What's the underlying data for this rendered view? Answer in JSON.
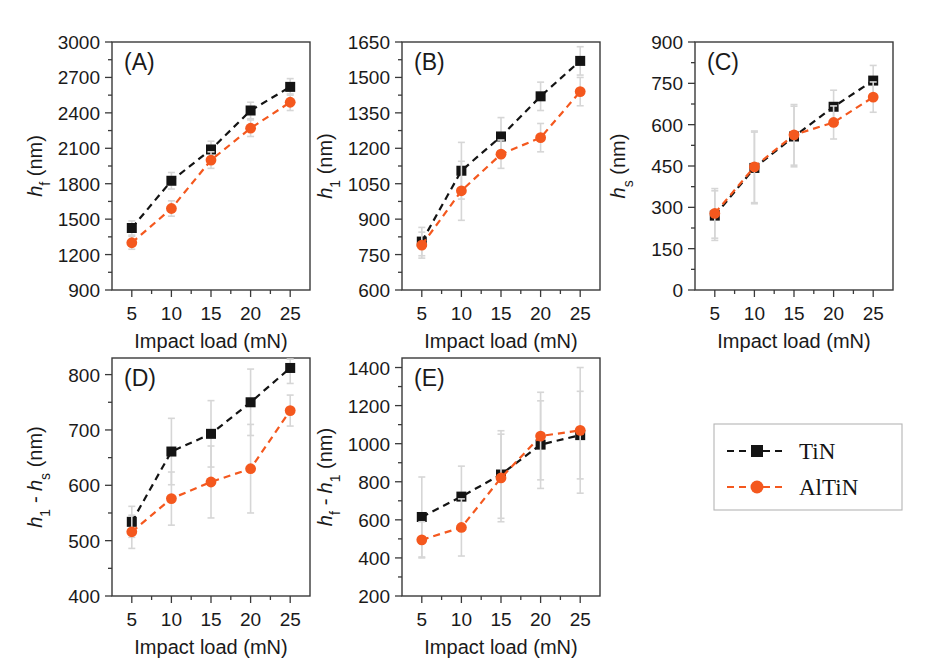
{
  "figure": {
    "background": "#ffffff",
    "series_colors": {
      "TiN": "#141414",
      "AlTiN": "#f4581e",
      "error_bar": "#d6d6d6"
    },
    "xlabel": "Impact load (mN)",
    "xticks": [
      "5",
      "10",
      "15",
      "20",
      "25"
    ],
    "units": "nm"
  },
  "legend": {
    "position": "bottom-right",
    "entries": [
      {
        "label": "TiN",
        "marker": "square",
        "color": "#141414",
        "line": "dashed"
      },
      {
        "label": "AlTiN",
        "marker": "circle",
        "color": "#f4581e",
        "line": "dashed"
      }
    ]
  },
  "panels": {
    "A": {
      "label": "(A)",
      "ylabel_html": "h_f (nm)",
      "ylabel_main": "h",
      "ylabel_sub": "f",
      "ylabel_unit": " (nm)",
      "yticks": [
        "900",
        "1200",
        "1500",
        "1800",
        "2100",
        "2400",
        "2700",
        "3000"
      ]
    },
    "B": {
      "label": "(B)",
      "ylabel_main": "h",
      "ylabel_sub": "1",
      "ylabel_unit": " (nm)",
      "yticks": [
        "600",
        "750",
        "900",
        "1050",
        "1200",
        "1350",
        "1500",
        "1650"
      ]
    },
    "C": {
      "label": "(C)",
      "ylabel_main": "h",
      "ylabel_sub": "s",
      "ylabel_unit": " (nm)",
      "yticks": [
        "0",
        "150",
        "300",
        "450",
        "600",
        "750",
        "900"
      ]
    },
    "D": {
      "label": "(D)",
      "ylabel_main": "h",
      "ylabel_sub": "1",
      "ylabel_mid": " - h",
      "ylabel_sub2": "s",
      "ylabel_unit": " (nm)",
      "yticks": [
        "400",
        "500",
        "600",
        "700",
        "800"
      ]
    },
    "E": {
      "label": "(E)",
      "ylabel_main": "h",
      "ylabel_sub": "f",
      "ylabel_mid": " - h",
      "ylabel_sub2": "1",
      "ylabel_unit": " (nm)",
      "yticks": [
        "200",
        "400",
        "600",
        "800",
        "1000",
        "1200",
        "1400"
      ]
    }
  },
  "chart_data": [
    {
      "panel": "A",
      "type": "line",
      "title": "(A)",
      "xlabel": "Impact load (mN)",
      "ylabel": "h_f (nm)",
      "x": [
        5,
        10,
        15,
        20,
        25
      ],
      "xlim": [
        2.5,
        27.5
      ],
      "ylim": [
        900,
        3000
      ],
      "yticks": [
        900,
        1200,
        1500,
        1800,
        2100,
        2400,
        2700,
        3000
      ],
      "grid": false,
      "series": [
        {
          "name": "TiN",
          "values": [
            1425,
            1825,
            2090,
            2420,
            2620
          ],
          "errors": [
            60,
            70,
            70,
            70,
            70
          ]
        },
        {
          "name": "AlTiN",
          "values": [
            1300,
            1590,
            2000,
            2270,
            2490
          ],
          "errors": [
            55,
            65,
            70,
            70,
            70
          ]
        }
      ]
    },
    {
      "panel": "B",
      "type": "line",
      "title": "(B)",
      "xlabel": "Impact load (mN)",
      "ylabel": "h_1 (nm)",
      "x": [
        5,
        10,
        15,
        20,
        25
      ],
      "xlim": [
        2.5,
        27.5
      ],
      "ylim": [
        600,
        1650
      ],
      "yticks": [
        600,
        750,
        900,
        1050,
        1200,
        1350,
        1500,
        1650
      ],
      "grid": false,
      "series": [
        {
          "name": "TiN",
          "values": [
            805,
            1105,
            1250,
            1420,
            1570
          ],
          "errors": [
            60,
            120,
            80,
            60,
            60
          ]
        },
        {
          "name": "AlTiN",
          "values": [
            790,
            1020,
            1175,
            1245,
            1440
          ],
          "errors": [
            55,
            125,
            60,
            60,
            60
          ]
        }
      ]
    },
    {
      "panel": "C",
      "type": "line",
      "title": "(C)",
      "xlabel": "Impact load (mN)",
      "ylabel": "h_s (nm)",
      "x": [
        5,
        10,
        15,
        20,
        25
      ],
      "xlim": [
        2.5,
        27.5
      ],
      "ylim": [
        0,
        900
      ],
      "yticks": [
        0,
        150,
        300,
        450,
        600,
        750,
        900
      ],
      "grid": false,
      "series": [
        {
          "name": "TiN",
          "values": [
            270,
            443,
            557,
            665,
            760
          ],
          "errors": [
            90,
            130,
            110,
            60,
            55
          ]
        },
        {
          "name": "AlTiN",
          "values": [
            278,
            447,
            563,
            608,
            700
          ],
          "errors": [
            90,
            130,
            110,
            60,
            55
          ]
        }
      ]
    },
    {
      "panel": "D",
      "type": "line",
      "title": "(D)",
      "xlabel": "Impact load (mN)",
      "ylabel": "h_1 - h_s (nm)",
      "x": [
        5,
        10,
        15,
        20,
        25
      ],
      "xlim": [
        2.5,
        27.5
      ],
      "ylim": [
        400,
        830
      ],
      "yticks": [
        400,
        500,
        600,
        700,
        800
      ],
      "grid": false,
      "series": [
        {
          "name": "TiN",
          "values": [
            534,
            661,
            693,
            750,
            812
          ],
          "errors": [
            28,
            60,
            60,
            60,
            28
          ]
        },
        {
          "name": "AlTiN",
          "values": [
            516,
            576,
            606,
            630,
            735
          ],
          "errors": [
            30,
            48,
            65,
            80,
            28
          ]
        }
      ]
    },
    {
      "panel": "E",
      "type": "line",
      "title": "(E)",
      "xlabel": "Impact load (mN)",
      "ylabel": "h_f - h_1 (nm)",
      "x": [
        5,
        10,
        15,
        20,
        25
      ],
      "xlim": [
        2.5,
        27.5
      ],
      "ylim": [
        200,
        1450
      ],
      "yticks": [
        200,
        400,
        600,
        800,
        1000,
        1200,
        1400
      ],
      "grid": false,
      "series": [
        {
          "name": "TiN",
          "values": [
            615,
            722,
            838,
            995,
            1045
          ],
          "errors": [
            210,
            160,
            230,
            230,
            230
          ]
        },
        {
          "name": "AlTiN",
          "values": [
            495,
            560,
            820,
            1040,
            1070
          ],
          "errors": [
            95,
            150,
            230,
            230,
            330
          ]
        }
      ]
    }
  ]
}
